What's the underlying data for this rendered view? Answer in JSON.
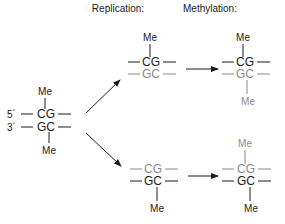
{
  "headers": {
    "replication": "Replication:",
    "methylation": "Methylation:"
  },
  "colors": {
    "parental_strand": "#1a1a1a",
    "new_strand": "#8a8a8a"
  },
  "parent": {
    "label_5prime": "5´",
    "label_3prime": "3´",
    "top_strand": "CG",
    "bottom_strand": "GC",
    "methyl_top": "Me",
    "methyl_bottom": "Me"
  },
  "upper_branch": {
    "replicated": {
      "top_strand": "CG",
      "bottom_strand": "GC",
      "methyl_top": "Me",
      "top_color": "black",
      "bottom_color": "gray"
    },
    "methylated": {
      "top_strand": "CG",
      "bottom_strand": "GC",
      "methyl_top": "Me",
      "methyl_bottom": "Me",
      "top_color": "black",
      "bottom_color": "gray"
    }
  },
  "lower_branch": {
    "replicated": {
      "top_strand": "CG",
      "bottom_strand": "GC",
      "methyl_bottom": "Me",
      "top_color": "gray",
      "bottom_color": "black"
    },
    "methylated": {
      "top_strand": "CG",
      "bottom_strand": "GC",
      "methyl_top": "Me",
      "methyl_bottom": "Me",
      "top_color": "gray",
      "bottom_color": "black"
    }
  }
}
